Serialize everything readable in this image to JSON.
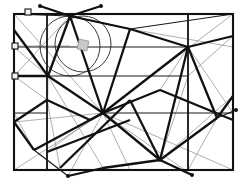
{
  "figure": {
    "width": 249,
    "height": 184,
    "background_color": "#ffffff",
    "colors": {
      "thick_stroke": "#111111",
      "mid_stroke": "#1a1a1a",
      "thin_stroke": "#8c8c8c",
      "circle_stroke": "#3a3a3a",
      "marker_fill": "#111111",
      "square_marker_fill": "#f2f2f2",
      "angle_marker_fill": "#c9c9c9"
    }
  },
  "frame": {
    "outer_rect": {
      "x": 14,
      "y": 14,
      "width": 219,
      "height": 156
    },
    "inner_vertical_left_x": 47,
    "inner_vertical_right_x": 188,
    "inner_horizontal_upper_y": 47,
    "inner_horizontal_mid_y": 76,
    "inner_horizontal_lower_y": 113
  },
  "circles": [
    {
      "cx": 70,
      "cy": 46,
      "r": 30,
      "label": "circle-left"
    },
    {
      "cx": 83,
      "cy": 44,
      "r": 28,
      "label": "circle-right"
    }
  ],
  "angle_marker": {
    "x": 78,
    "y": 40,
    "size": 10,
    "label": "right-angle-marker"
  },
  "hubs": [
    {
      "x": 103,
      "y": 113,
      "label": "hub-center"
    },
    {
      "x": 48,
      "y": 76,
      "label": "hub-left"
    },
    {
      "x": 160,
      "y": 160,
      "label": "hub-bottom"
    },
    {
      "x": 70,
      "y": 16,
      "label": "hub-top"
    }
  ],
  "point_markers": [
    {
      "x": 28,
      "y": 12,
      "type": "square",
      "label": "marker-top-left-corner"
    },
    {
      "x": 15,
      "y": 46,
      "type": "square",
      "label": "marker-left-edge-upper"
    },
    {
      "x": 15,
      "y": 76,
      "type": "square",
      "label": "marker-left-edge-mid"
    },
    {
      "x": 40,
      "y": 6,
      "type": "dot",
      "label": "marker-above-top-left"
    },
    {
      "x": 101,
      "y": 6,
      "type": "dot",
      "label": "marker-above-top-right"
    },
    {
      "x": 236,
      "y": 110,
      "type": "dot",
      "label": "marker-right-edge"
    },
    {
      "x": 68,
      "y": 176,
      "type": "dot",
      "label": "marker-below-bottom-left"
    },
    {
      "x": 192,
      "y": 175,
      "type": "dot",
      "label": "marker-below-bottom-right"
    }
  ],
  "thick_segments": [
    [
      14,
      30,
      48,
      76
    ],
    [
      48,
      76,
      70,
      16
    ],
    [
      70,
      16,
      103,
      113
    ],
    [
      48,
      76,
      103,
      113
    ],
    [
      103,
      113,
      130,
      29
    ],
    [
      130,
      29,
      70,
      16
    ],
    [
      103,
      113,
      188,
      47
    ],
    [
      130,
      29,
      188,
      47
    ],
    [
      188,
      47,
      233,
      36
    ],
    [
      103,
      113,
      160,
      160
    ],
    [
      160,
      160,
      188,
      47
    ],
    [
      160,
      160,
      103,
      168
    ],
    [
      14,
      122,
      47,
      100
    ],
    [
      47,
      100,
      90,
      120
    ],
    [
      90,
      120,
      103,
      113
    ],
    [
      14,
      122,
      34,
      150
    ],
    [
      34,
      150,
      103,
      113
    ],
    [
      47,
      152,
      130,
      120
    ],
    [
      60,
      168,
      130,
      100
    ],
    [
      130,
      100,
      160,
      160
    ],
    [
      160,
      160,
      217,
      118
    ],
    [
      217,
      118,
      233,
      96
    ],
    [
      188,
      47,
      217,
      118
    ],
    [
      48,
      76,
      14,
      76
    ],
    [
      70,
      16,
      40,
      6
    ],
    [
      101,
      6,
      70,
      16
    ],
    [
      103,
      168,
      68,
      176
    ],
    [
      160,
      160,
      192,
      175
    ],
    [
      103,
      113,
      160,
      90
    ],
    [
      160,
      90,
      233,
      120
    ]
  ],
  "mid_segments": [
    [
      14,
      14,
      70,
      16
    ],
    [
      70,
      16,
      130,
      29
    ],
    [
      130,
      29,
      233,
      14
    ],
    [
      47,
      47,
      188,
      47
    ],
    [
      14,
      47,
      47,
      47
    ],
    [
      48,
      76,
      188,
      76
    ],
    [
      103,
      113,
      233,
      113
    ],
    [
      14,
      113,
      48,
      113
    ],
    [
      47,
      14,
      47,
      170
    ],
    [
      188,
      14,
      188,
      170
    ],
    [
      34,
      150,
      68,
      176
    ],
    [
      217,
      118,
      236,
      110
    ]
  ],
  "thin_segments": [
    [
      14,
      14,
      103,
      113
    ],
    [
      233,
      14,
      103,
      113
    ],
    [
      14,
      170,
      103,
      113
    ],
    [
      233,
      170,
      103,
      113
    ],
    [
      70,
      16,
      14,
      76
    ],
    [
      70,
      16,
      48,
      76
    ],
    [
      130,
      29,
      103,
      113
    ],
    [
      188,
      47,
      103,
      113
    ],
    [
      48,
      76,
      14,
      47
    ],
    [
      48,
      76,
      47,
      170
    ],
    [
      103,
      113,
      68,
      176
    ],
    [
      103,
      113,
      192,
      175
    ],
    [
      160,
      160,
      188,
      76
    ],
    [
      160,
      160,
      233,
      96
    ],
    [
      14,
      122,
      103,
      113
    ],
    [
      47,
      100,
      14,
      76
    ],
    [
      34,
      150,
      14,
      113
    ],
    [
      60,
      168,
      47,
      100
    ],
    [
      188,
      47,
      233,
      113
    ],
    [
      217,
      118,
      188,
      170
    ],
    [
      130,
      29,
      233,
      47
    ],
    [
      233,
      36,
      188,
      76
    ],
    [
      160,
      90,
      188,
      47
    ],
    [
      90,
      120,
      47,
      152
    ],
    [
      14,
      46,
      70,
      46
    ],
    [
      103,
      113,
      130,
      170
    ],
    [
      48,
      76,
      103,
      168
    ]
  ]
}
